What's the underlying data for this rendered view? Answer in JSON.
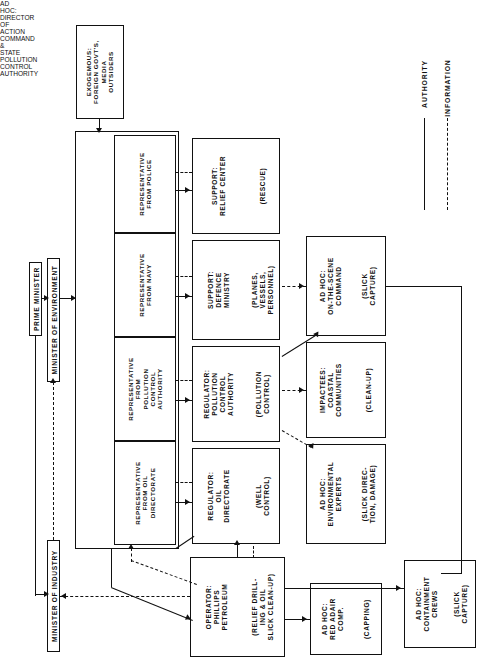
{
  "page": {
    "header_left": "",
    "header_right": ""
  },
  "legend": {
    "authority": "AUTHORITY",
    "information": "INFORMATION"
  },
  "nodes": {
    "exogenous": {
      "title": "EXOGEMOUS:\nFOREIGN GOVT'S,\nMEDIA\nOUTSIDERS",
      "paren": ""
    },
    "prime_minister": {
      "title": "PRIME MINISTER"
    },
    "minister_env": {
      "title": "MINISTER OF ENVIRONMENT"
    },
    "minister_ind": {
      "title": "MINISTER OF INDUSTRY"
    },
    "director_group": {
      "title": "AD HOC:\nDIRECTOR OF ACTION COMMAND & STATE POLLUTION CONTROL AUTHORITY"
    },
    "rep_oil": {
      "title": "REPRESENTATIVE\nFROM OIL\nDIRECTORATE"
    },
    "rep_pca": {
      "title": "REPRESENTATIVE\nFROM\nPOLLUTION\nCONTROL\nAUTHORITY"
    },
    "rep_navy": {
      "title": "REPRESENTATIVE\nFROM NAVY"
    },
    "rep_police": {
      "title": "REPRESENTATIVE\nFROM POLICE"
    },
    "reg_oil": {
      "title": "REGULATOR:\nOIL\nDIRECTORATE",
      "paren": "(WELL\nCONTROL)"
    },
    "reg_pca": {
      "title": "REGULATOR:\nPOLLUTION\nCONTROL\nAUTHORITY",
      "paren": "(POLLUTION\nCONTROL)"
    },
    "sup_defence": {
      "title": "SUPPORT:\nDEFENCE\nMINISTRY",
      "paren": "(PLANES,\nVESSELS,\nPERSONNEL)"
    },
    "sup_relief": {
      "title": "SUPPORT:\nRELIEF CENTER",
      "paren": "(RESCUE)"
    },
    "env_experts": {
      "title": "AD HOC:\nENVIRONMENTAL\nEXPERTS",
      "paren": "(SLICK DIREC-\nTION, DAMAGE)"
    },
    "impactees": {
      "title": "IMPACTEES:\nCOASTAL\nCOMMUNITIES",
      "paren": "(CLEAN-UP)"
    },
    "on_scene": {
      "title": "AD HOC:\nON-THE-SCENE\nCOMMAND",
      "paren": "(SLICK\nCAPTURE)"
    },
    "operator": {
      "title": "OPERATOR:\nPHILLIPS\nPETROLEUM",
      "paren": "(RELIEF DRILL-\nING & OIL\nSLICK CLEAN-UP)"
    },
    "red_adair": {
      "title": "AD HOC:\nRED ADAIR\nCOMP.",
      "paren": "(CAPPING)"
    },
    "containment": {
      "title": "AD HOC:\nCONTAINMENT\nCREWS",
      "paren": "(SLICK\nCAPTURE)"
    }
  }
}
